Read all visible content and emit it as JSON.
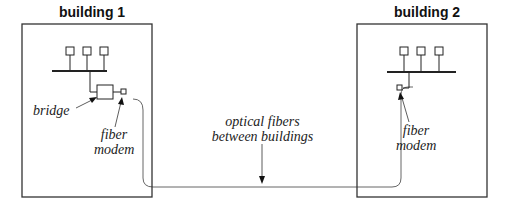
{
  "buildings": [
    {
      "title": "building 1",
      "labels": {
        "bridge": "bridge",
        "fiber_modem_line1": "fiber",
        "fiber_modem_line2": "modem"
      }
    },
    {
      "title": "building 2",
      "labels": {
        "fiber_modem_line1": "fiber",
        "fiber_modem_line2": "modem"
      }
    }
  ],
  "fiber_label": {
    "line1": "optical fibers",
    "line2": "between buildings"
  }
}
